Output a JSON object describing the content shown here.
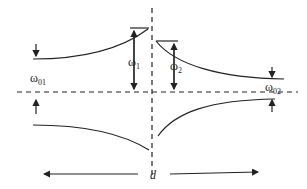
{
  "diagram": {
    "type": "avoided crossing / dispersion diagram",
    "labels": {
      "omega_01": {
        "base": "ω",
        "sub": "01"
      },
      "omega_1": {
        "base": "ω",
        "sub": "1"
      },
      "omega_2": {
        "base": "ω",
        "sub": "2"
      },
      "omega_02": {
        "base": "ω",
        "sub": "02"
      },
      "d": "d"
    },
    "axes": {
      "horizontal_dashed": "baseline",
      "vertical_dashed": "center"
    },
    "colors": {
      "stroke": "#222222",
      "background": "#ffffff"
    }
  }
}
